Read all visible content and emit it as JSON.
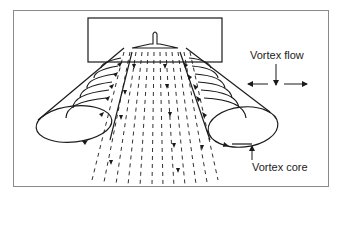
{
  "diagram": {
    "type": "aircraft wake vortex schematic",
    "labels": {
      "vortex_flow": "Vortex flow",
      "vortex_core": "Vortex core"
    },
    "elements": [
      "wing-planform-box",
      "aircraft-tail",
      "left-vortex-cylinder",
      "right-vortex-cylinder",
      "downwash-dashed-lines",
      "vortex-flow-arrows",
      "vortex-core-pointer"
    ],
    "colors": {
      "line": "#1a1a1a",
      "frame": "#8a8a8a",
      "background": "#ffffff"
    }
  }
}
